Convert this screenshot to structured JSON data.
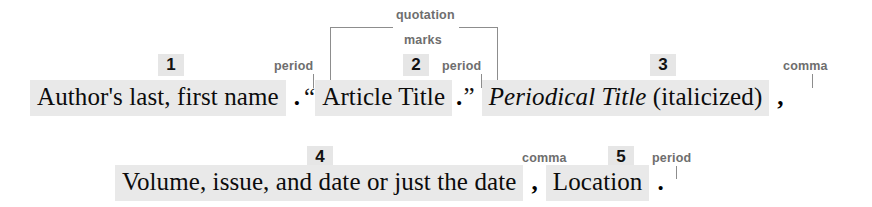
{
  "diagram": {
    "colors": {
      "highlight": "#e9e9e9",
      "badge_bg": "#e6e6e6",
      "label_text": "#6e6e6e",
      "leader_line": "#8d8d8d",
      "body_text": "#0c0c0c",
      "page_bg": "#ffffff"
    }
  },
  "line1": {
    "part1_text": "Author's last, first name",
    "punct1": ".",
    "open_quote": "“",
    "part2_text": "Article Title",
    "punct2": ".",
    "close_quote": "”",
    "part3_italic": "Periodical Title",
    "part3_paren": "(italicized)",
    "punct3": ","
  },
  "line2": {
    "part4_text": "Volume, issue, and date or just the date",
    "punct4": ",",
    "part5_text": "Location",
    "punct5": "."
  },
  "badges": [
    {
      "number": "1"
    },
    {
      "number": "2"
    },
    {
      "number": "3"
    },
    {
      "number": "4"
    },
    {
      "number": "5"
    }
  ],
  "labels": {
    "period_1": "period",
    "quotation_line1": "quotation",
    "quotation_line2": "marks",
    "period_2": "period",
    "comma_1": "comma",
    "comma_2": "comma",
    "period_3": "period"
  }
}
